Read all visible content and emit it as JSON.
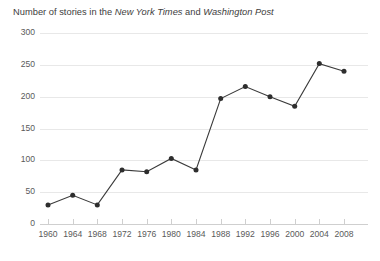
{
  "title": {
    "prefix": "Number of stories in the ",
    "paper1": "New York Times",
    "middle": " and ",
    "paper2": "Washington Post"
  },
  "colors": {
    "line": "#3a3a3a",
    "marker": "#2e2e2e",
    "gridline": "#e8e8e8",
    "axis": "#cfcfcf",
    "text": "#5a5a5a",
    "background": "#ffffff"
  },
  "chart_data": {
    "type": "line",
    "title": "Number of stories in the New York Times and Washington Post",
    "xlabel": "",
    "ylabel": "",
    "x": [
      1960,
      1964,
      1968,
      1972,
      1976,
      1980,
      1984,
      1988,
      1992,
      1996,
      2000,
      2004,
      2008
    ],
    "values": [
      30,
      45,
      30,
      85,
      82,
      103,
      85,
      197,
      216,
      200,
      185,
      252,
      240
    ],
    "categories": [
      "1960",
      "1964",
      "1968",
      "1972",
      "1976",
      "1980",
      "1984",
      "1988",
      "1992",
      "1996",
      "2000",
      "2004",
      "2008"
    ],
    "xtick_labels": [
      "1960",
      "1964",
      "1968",
      "1972",
      "1976",
      "1980",
      "1984",
      "1988",
      "1992",
      "1996",
      "2000",
      "2004",
      "2008"
    ],
    "ytick_labels": [
      "0",
      "50",
      "100",
      "150",
      "200",
      "250",
      "300"
    ],
    "yticks": [
      0,
      50,
      100,
      150,
      200,
      250,
      300
    ],
    "ylim": [
      0,
      300
    ],
    "xlim": [
      1960,
      2008
    ],
    "grid": true,
    "legend": false,
    "markers": true
  }
}
